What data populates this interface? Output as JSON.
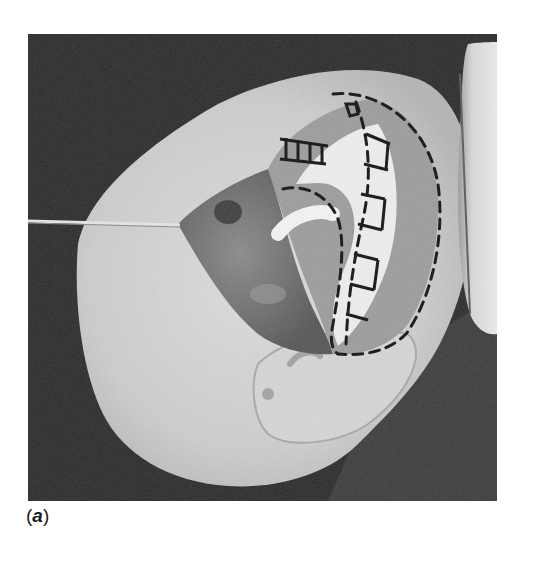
{
  "figure": {
    "caption": {
      "open": "(",
      "label": "a",
      "close": ")"
    },
    "palette": {
      "background_dark": "#2b2b2b",
      "skin": "#cfcfcf",
      "skin_light": "#e2e2e2",
      "wound": "#7a7a7a",
      "cartilage": "#f2f2f2",
      "marker": "#111111",
      "probe": "#e8e8e8"
    }
  }
}
